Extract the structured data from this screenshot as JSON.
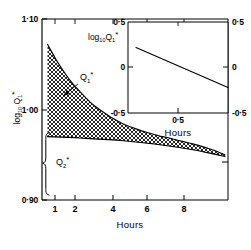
{
  "figure": {
    "title": "",
    "background": "#ffffff",
    "line_color": "#000000"
  },
  "main": {
    "ylabel_parts": {
      "log": "log",
      "base": "10",
      "q": "Q",
      "qsub": "1",
      "star": "*"
    },
    "ylabel_text": "log10 Q1*",
    "xlabel": "Hours",
    "y_ticks": [
      "1·10",
      "1·00",
      "0·90"
    ],
    "y_tick_values": [
      1.1,
      1.0,
      0.9
    ],
    "x_ticks": [
      "1",
      "2",
      "4",
      "6",
      "8"
    ],
    "x_tick_values": [
      1,
      2,
      4,
      6,
      8
    ],
    "curve1_label": {
      "q": "Q",
      "sub": "1",
      "star": "*"
    },
    "curve2_label": {
      "q": "Q",
      "sub": "2",
      "star": "*"
    }
  },
  "inset": {
    "label_parts": {
      "log": "log",
      "base": "10",
      "q": "Q",
      "qsub": "1",
      "star": "*"
    },
    "label_text": "log10 Q1*",
    "xlabel": "Hours",
    "y_ticks_left": [
      "0·5",
      "0",
      "-0·5"
    ],
    "y_ticks_right": [
      "0·5",
      "0",
      "-0·5"
    ],
    "y_tick_values": [
      0.5,
      0.0,
      -0.5
    ],
    "x_ticks": [
      "0·5"
    ],
    "x_tick_values": [
      0.5
    ]
  },
  "chart_data": {
    "type": "line",
    "title": "",
    "xlabel": "Hours",
    "ylabel": "log10 Q1*",
    "xscale": "log",
    "xlim": [
      0.55,
      10.5
    ],
    "ylim": [
      0.9,
      1.1
    ],
    "grid": false,
    "legend": "none",
    "annotations": [
      {
        "text": "Q1*",
        "x": 1.55,
        "y": 1.045,
        "note": "arrow points down-left to upper curve"
      },
      {
        "text": "Q2*",
        "x": 0.78,
        "y": 0.955,
        "note": "brace spanning lower band at left edge"
      }
    ],
    "series": [
      {
        "name": "Q1* upper bound",
        "style": "solid",
        "x": [
          0.6,
          0.65,
          0.7,
          0.8,
          0.9,
          1.0,
          1.2,
          1.4,
          1.7,
          2.0,
          2.5,
          3.0,
          3.5,
          4.0,
          5.0,
          6.0,
          7.0,
          8.0,
          9.0,
          10.0
        ],
        "y": [
          1.072,
          1.062,
          1.053,
          1.039,
          1.028,
          1.02,
          1.007,
          0.999,
          0.99,
          0.984,
          0.978,
          0.974,
          0.971,
          0.969,
          0.965,
          0.962,
          0.959,
          0.956,
          0.953,
          0.95
        ]
      },
      {
        "name": "Q2* lower bound",
        "style": "solid",
        "x": [
          0.6,
          1.0,
          2.0,
          4.0,
          6.0,
          8.0,
          10.0
        ],
        "y": [
          0.97,
          0.9685,
          0.9655,
          0.96,
          0.9555,
          0.9515,
          0.948
        ]
      }
    ],
    "fill_between": {
      "series_a": "Q1* upper bound",
      "series_b": "Q2* lower bound",
      "pattern": "cross-hatch",
      "color": "#000000"
    },
    "inset": {
      "type": "line",
      "xlabel": "Hours",
      "ylabel": "log10 Q1*",
      "xscale": "linear",
      "xlim": [
        0,
        1.0
      ],
      "ylim": [
        -0.5,
        0.5
      ],
      "x_ticks": [
        0.5
      ],
      "y_ticks": [
        -0.5,
        0.0,
        0.5
      ],
      "grid": false,
      "series": [
        {
          "name": "log10 Q1*",
          "style": "solid",
          "x": [
            0.08,
            1.0
          ],
          "y": [
            0.22,
            -0.22
          ]
        }
      ]
    }
  }
}
